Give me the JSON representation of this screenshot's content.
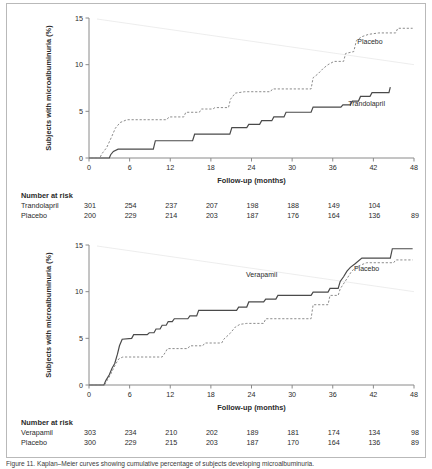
{
  "figure": {
    "caption": "Figure 11. Kaplan–Meier curves showing cumulative percentage of subjects developing microalbuminuria.",
    "border_color": "#b9b9b9",
    "background": "#ffffff"
  },
  "axis": {
    "y_label": "Subjects with microalbuminuria (%)",
    "x_label": "Follow-up (months)",
    "y_ticks": [
      "0",
      "5",
      "10",
      "15"
    ],
    "y_tick_values": [
      0,
      5,
      10,
      15
    ],
    "x_ticks": [
      "0",
      "6",
      "12",
      "18",
      "24",
      "30",
      "36",
      "42",
      "48"
    ],
    "x_tick_values": [
      0,
      6,
      12,
      18,
      24,
      30,
      36,
      42,
      48
    ],
    "xlim": [
      0,
      48
    ],
    "ylim": [
      0,
      15
    ]
  },
  "risk_table": {
    "header": "Number at risk"
  },
  "colors": {
    "solid_curve": "#4a4a4a",
    "dashed_curve": "#8c8c8c",
    "axis": "#8a8a8a",
    "text": "#2b2b2b"
  },
  "chart_data": [
    {
      "type": "line",
      "panel": "top",
      "title": "",
      "xlabel": "Follow-up (months)",
      "ylabel": "Subjects with microalbuminuria (%)",
      "xlim": [
        0,
        48
      ],
      "ylim": [
        0,
        15
      ],
      "grid": false,
      "legend": "inline-annotations",
      "annotations": [
        {
          "text": "Placebo",
          "x": 41.5,
          "y": 12.2
        },
        {
          "text": "Trandolapril",
          "x": 41.0,
          "y": 5.6
        }
      ],
      "series": [
        {
          "name": "Trandolapril",
          "style": "solid",
          "color": "#4a4a4a",
          "points": [
            [
              0,
              0
            ],
            [
              3.0,
              0
            ],
            [
              3.2,
              0.35
            ],
            [
              3.6,
              0.7
            ],
            [
              4.3,
              0.95
            ],
            [
              9.5,
              0.95
            ],
            [
              9.8,
              1.85
            ],
            [
              15.3,
              1.85
            ],
            [
              15.6,
              2.55
            ],
            [
              20.8,
              2.55
            ],
            [
              21.1,
              3.25
            ],
            [
              23.3,
              3.25
            ],
            [
              23.6,
              3.6
            ],
            [
              25.2,
              3.6
            ],
            [
              25.5,
              4.0
            ],
            [
              27.0,
              4.0
            ],
            [
              27.3,
              4.4
            ],
            [
              28.8,
              4.4
            ],
            [
              29.1,
              4.9
            ],
            [
              32.8,
              4.9
            ],
            [
              33.1,
              5.45
            ],
            [
              37.2,
              5.45
            ],
            [
              37.5,
              5.7
            ],
            [
              38.6,
              5.7
            ],
            [
              38.9,
              6.1
            ],
            [
              39.8,
              6.1
            ],
            [
              40.1,
              6.6
            ],
            [
              41.5,
              6.6
            ],
            [
              41.8,
              7.0
            ],
            [
              44.3,
              7.0
            ],
            [
              44.5,
              7.6
            ]
          ]
        },
        {
          "name": "Placebo",
          "style": "dashed",
          "color": "#8c8c8c",
          "points": [
            [
              0,
              0
            ],
            [
              1.6,
              0
            ],
            [
              1.9,
              0.45
            ],
            [
              2.6,
              1.1
            ],
            [
              3.3,
              2.2
            ],
            [
              3.9,
              3.2
            ],
            [
              4.6,
              3.8
            ],
            [
              5.6,
              4.1
            ],
            [
              11.5,
              4.1
            ],
            [
              11.8,
              4.4
            ],
            [
              14.0,
              4.4
            ],
            [
              14.3,
              4.9
            ],
            [
              16.3,
              4.9
            ],
            [
              16.6,
              5.25
            ],
            [
              18.3,
              5.25
            ],
            [
              18.6,
              5.4
            ],
            [
              20.6,
              5.4
            ],
            [
              20.9,
              6.3
            ],
            [
              21.6,
              6.95
            ],
            [
              23.0,
              7.1
            ],
            [
              26.8,
              7.1
            ],
            [
              27.1,
              7.4
            ],
            [
              32.8,
              7.4
            ],
            [
              33.1,
              8.6
            ],
            [
              33.8,
              9.0
            ],
            [
              34.6,
              9.6
            ],
            [
              35.3,
              10.0
            ],
            [
              36.2,
              10.35
            ],
            [
              37.6,
              10.35
            ],
            [
              37.9,
              11.2
            ],
            [
              39.1,
              11.4
            ],
            [
              39.5,
              12.6
            ],
            [
              40.3,
              13.0
            ],
            [
              41.3,
              13.25
            ],
            [
              42.8,
              13.4
            ],
            [
              45.3,
              13.4
            ],
            [
              45.6,
              13.9
            ],
            [
              47.8,
              13.9
            ]
          ]
        }
      ],
      "risk_table": {
        "header": "Number at risk",
        "times": [
          0,
          6,
          12,
          18,
          24,
          30,
          36,
          42,
          48
        ],
        "rows": [
          {
            "label": "Trandolapril",
            "values": [
              "301",
              "254",
              "237",
              "207",
              "198",
              "188",
              "149",
              "104",
              ""
            ]
          },
          {
            "label": "Placebo",
            "values": [
              "200",
              "229",
              "214",
              "203",
              "187",
              "176",
              "164",
              "136",
              "89"
            ]
          }
        ]
      }
    },
    {
      "type": "line",
      "panel": "bottom",
      "title": "",
      "xlabel": "Follow-up (months)",
      "ylabel": "Subjects with microalbuminuria (%)",
      "xlim": [
        0,
        48
      ],
      "ylim": [
        0,
        15
      ],
      "grid": false,
      "legend": "inline-annotations",
      "annotations": [
        {
          "text": "Verapamil",
          "x": 25.5,
          "y": 11.6
        },
        {
          "text": "Placebo",
          "x": 41.0,
          "y": 12.2
        }
      ],
      "series": [
        {
          "name": "Verapamil",
          "style": "solid",
          "color": "#4a4a4a",
          "points": [
            [
              0,
              0
            ],
            [
              2.2,
              0
            ],
            [
              2.5,
              0.5
            ],
            [
              3.0,
              1.1
            ],
            [
              3.4,
              1.8
            ],
            [
              3.8,
              2.3
            ],
            [
              4.2,
              3.3
            ],
            [
              4.5,
              4.2
            ],
            [
              4.9,
              4.9
            ],
            [
              6.3,
              5.0
            ],
            [
              6.6,
              5.4
            ],
            [
              8.6,
              5.4
            ],
            [
              8.9,
              5.6
            ],
            [
              9.6,
              5.6
            ],
            [
              9.9,
              6.0
            ],
            [
              10.5,
              6.0
            ],
            [
              10.8,
              6.4
            ],
            [
              11.4,
              6.4
            ],
            [
              11.7,
              6.8
            ],
            [
              12.3,
              6.8
            ],
            [
              12.6,
              7.1
            ],
            [
              14.6,
              7.1
            ],
            [
              14.9,
              7.4
            ],
            [
              15.9,
              7.4
            ],
            [
              16.2,
              8.0
            ],
            [
              21.8,
              8.0
            ],
            [
              22.1,
              8.35
            ],
            [
              23.3,
              8.35
            ],
            [
              23.6,
              8.9
            ],
            [
              25.8,
              8.9
            ],
            [
              26.1,
              9.2
            ],
            [
              27.6,
              9.2
            ],
            [
              27.9,
              9.6
            ],
            [
              32.8,
              9.6
            ],
            [
              33.1,
              9.95
            ],
            [
              35.3,
              9.95
            ],
            [
              35.6,
              10.35
            ],
            [
              36.8,
              10.35
            ],
            [
              37.1,
              11.1
            ],
            [
              37.6,
              11.6
            ],
            [
              38.1,
              12.2
            ],
            [
              38.6,
              12.6
            ],
            [
              39.3,
              13.0
            ],
            [
              40.3,
              13.6
            ],
            [
              44.5,
              13.6
            ],
            [
              44.8,
              14.6
            ],
            [
              47.8,
              14.6
            ]
          ]
        },
        {
          "name": "Placebo",
          "style": "dashed",
          "color": "#8c8c8c",
          "points": [
            [
              0,
              0
            ],
            [
              2.3,
              0
            ],
            [
              2.6,
              0.4
            ],
            [
              3.1,
              1.0
            ],
            [
              3.5,
              1.6
            ],
            [
              3.9,
              2.2
            ],
            [
              4.4,
              2.8
            ],
            [
              5.0,
              3.0
            ],
            [
              10.8,
              3.0
            ],
            [
              11.1,
              3.3
            ],
            [
              11.6,
              3.9
            ],
            [
              14.6,
              3.9
            ],
            [
              14.9,
              4.2
            ],
            [
              16.8,
              4.2
            ],
            [
              17.1,
              4.5
            ],
            [
              19.6,
              4.5
            ],
            [
              19.9,
              4.9
            ],
            [
              20.8,
              5.5
            ],
            [
              21.6,
              6.2
            ],
            [
              22.3,
              6.5
            ],
            [
              23.3,
              6.6
            ],
            [
              25.8,
              6.6
            ],
            [
              26.1,
              7.1
            ],
            [
              32.8,
              7.1
            ],
            [
              33.1,
              8.6
            ],
            [
              35.3,
              8.6
            ],
            [
              35.6,
              9.6
            ],
            [
              36.8,
              9.6
            ],
            [
              37.1,
              10.3
            ],
            [
              38.1,
              11.4
            ],
            [
              38.8,
              12.2
            ],
            [
              39.6,
              12.7
            ],
            [
              41.0,
              13.1
            ],
            [
              45.0,
              13.1
            ],
            [
              45.3,
              13.4
            ],
            [
              47.8,
              13.4
            ]
          ]
        }
      ],
      "risk_table": {
        "header": "Number at risk",
        "times": [
          0,
          6,
          12,
          18,
          24,
          30,
          36,
          42,
          48
        ],
        "rows": [
          {
            "label": "Verapamil",
            "values": [
              "303",
              "234",
              "210",
              "202",
              "189",
              "181",
              "174",
              "134",
              "98"
            ]
          },
          {
            "label": "Placebo",
            "values": [
              "300",
              "229",
              "215",
              "203",
              "187",
              "170",
              "164",
              "136",
              "89"
            ]
          }
        ]
      }
    }
  ]
}
